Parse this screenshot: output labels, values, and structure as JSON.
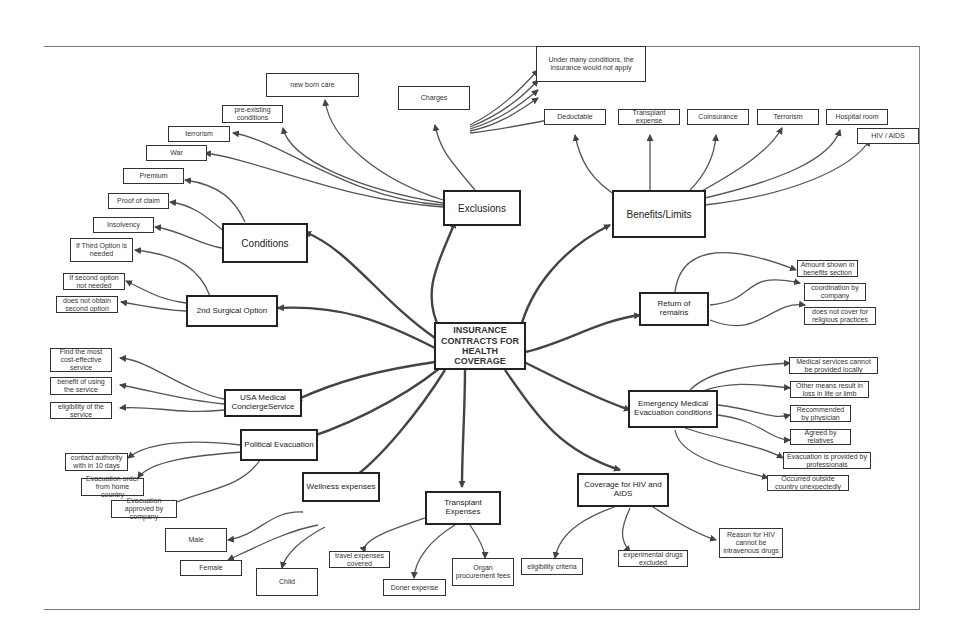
{
  "root": {
    "label": "INSURANCE CONTRACTS FOR HEALTH COVERAGE"
  },
  "hubs": {
    "exclusions": {
      "label": "Exclusions"
    },
    "benefits": {
      "label": "Benefits/Limits"
    },
    "conditions": {
      "label": "Conditions"
    },
    "surgical": {
      "label": "2nd Surgical Option"
    },
    "remains": {
      "label": "Return of remains"
    },
    "concierge": {
      "label": "USA Medical ConciergeService"
    },
    "emergency": {
      "label": "Emergency Medical Evacuation conditions"
    },
    "political": {
      "label": "Political Evacuation"
    },
    "wellness": {
      "label": "Wellness expenses"
    },
    "transplant": {
      "label": "Transplant Expenses"
    },
    "hiv": {
      "label": "Coverage for HIV and AIDS"
    }
  },
  "leaves": {
    "charges": "Charges",
    "charges_note": "Under many conditions, the insurance would not apply",
    "newborn": "new born care",
    "preexisting": "pre-existing conditions",
    "terrorism_ex": "terrorism",
    "war": "War",
    "premium": "Premium",
    "proof": "Proof of claim",
    "insolvency": "Insolvency",
    "third_option": "If Third Option is needed",
    "second_not_needed": "If second option not needed",
    "no_second": "does not obtain second option",
    "deductable": "Deductable",
    "transplant_expense": "Transplant expense",
    "coinsurance": "Coinsurance",
    "terrorism_ben": "Terrorism",
    "hospital_room": "Hospital room",
    "hiv_aids": "HIV / AIDS",
    "amount_shown": "Amount shown in benefits section",
    "coordination": "coordination by company",
    "religious": "does not cover for religious practices",
    "cost_effective": "Find the most cost-effective service",
    "benefit_using": "benefit of using the service",
    "eligibility_service": "eligibility of the service",
    "contact_authority": "contact authority with in 10 days",
    "evac_order": "Evacuation order from home country",
    "evac_approved": "Evacuation approved by company",
    "med_local": "Medical services cannot be provided locally",
    "other_means": "Other means result in loss in life or limb",
    "recommended": "Recommended by physician",
    "agreed": "Agreed by relatives",
    "evac_professionals": "Evacuation is provided by professionals",
    "occurred_outside": "Occurred outside country unexpectedly",
    "male": "Male",
    "female": "Female",
    "child": "Child",
    "travel": "travel expenses covered",
    "doner": "Doner expense",
    "organ": "Organ procurement fees",
    "eligibility_criteria": "eligibility criteria",
    "experimental": "experimental drugs excluded",
    "reason_hiv": "Reason for HIV cannot be intravenous drugs"
  }
}
